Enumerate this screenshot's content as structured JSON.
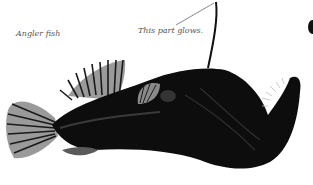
{
  "figure": {
    "labels": {
      "species": "Angler fish",
      "annotation": "This part glows."
    },
    "colors": {
      "background": "#ffffff",
      "fish_body": "#0d0d0d",
      "fin_light": "#9a9a9a",
      "label_text": "#555555",
      "leader_line": "#6a6a6a"
    }
  }
}
